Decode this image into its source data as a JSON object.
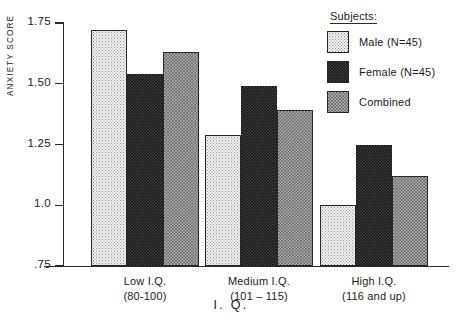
{
  "chart_data": {
    "type": "bar",
    "title": "",
    "xlabel": "I. Q.",
    "ylabel": "ANXIETY SCORE",
    "ylim": [
      0.75,
      1.75
    ],
    "yticks": [
      1.75,
      1.5,
      1.25,
      1.0,
      0.75
    ],
    "ytick_labels": [
      "1.75",
      "1.50",
      "1.25",
      "1.0",
      ".75"
    ],
    "grid": false,
    "legend_position": "top-right",
    "categories": [
      "Low I.Q.",
      "Medium I.Q.",
      "High I.Q."
    ],
    "category_sublabels": [
      "(80-100)",
      "(101 – 115)",
      "(116 and up)"
    ],
    "series": [
      {
        "name": "Male (N=45)",
        "key": "male",
        "pattern": "light-stipple",
        "values": [
          1.72,
          1.29,
          1.0
        ]
      },
      {
        "name": "Female (N=45)",
        "key": "female",
        "pattern": "dark-checker",
        "values": [
          1.54,
          1.49,
          1.25
        ]
      },
      {
        "name": "Combined",
        "key": "combined",
        "pattern": "medium-checker",
        "values": [
          1.63,
          1.39,
          1.12
        ]
      }
    ]
  },
  "legend": {
    "title": "Subjects:",
    "items": [
      {
        "label": "Male (N=45)"
      },
      {
        "label": "Female (N=45)"
      },
      {
        "label": "Combined"
      }
    ]
  },
  "axes": {
    "y_title": "ANXIETY SCORE",
    "x_title": "I. Q.",
    "y_ticks": [
      {
        "label": "1.75"
      },
      {
        "label": "1.50"
      },
      {
        "label": "1.25"
      },
      {
        "label": "1.0"
      },
      {
        "label": ".75"
      }
    ]
  },
  "groups": [
    {
      "label": "Low I.Q.",
      "sublabel": "(80-100)"
    },
    {
      "label": "Medium I.Q.",
      "sublabel": "(101 – 115)"
    },
    {
      "label": "High I.Q.",
      "sublabel": "(116 and up)"
    }
  ],
  "colors": {
    "axis": "#2a2a2a",
    "text": "#1a1a1a",
    "male_fill": "#f4f4f4",
    "female_fill": "#151515",
    "combined_fill": "#b9b9b9",
    "background": "#ffffff"
  }
}
